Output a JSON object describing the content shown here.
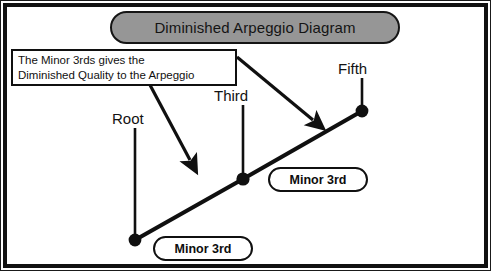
{
  "diagram": {
    "title": "Diminished Arpeggio Diagram",
    "callout": {
      "line1": "The Minor 3rds gives the",
      "line2": "Diminished Quality to the Arpeggio"
    },
    "nodes": [
      {
        "id": "root",
        "label": "Root",
        "x": 135,
        "y": 240
      },
      {
        "id": "third",
        "label": "Third",
        "x": 243,
        "y": 179
      },
      {
        "id": "fifth",
        "label": "Fifth",
        "x": 362,
        "y": 111
      }
    ],
    "intervals": [
      {
        "id": "lower",
        "label": "Minor 3rd",
        "between": "Root to Third"
      },
      {
        "id": "upper",
        "label": "Minor 3rd",
        "between": "Third to Fifth"
      }
    ],
    "colors": {
      "frame": "#111111",
      "title_fill": "#969696",
      "stroke": "#101010",
      "background": "#ffffff",
      "text": "#121212"
    }
  }
}
